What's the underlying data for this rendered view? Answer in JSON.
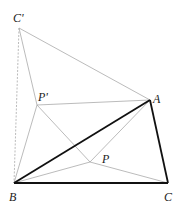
{
  "diagram": {
    "points": {
      "C_prime": {
        "label": "C'",
        "x": 19,
        "y": 28
      },
      "A": {
        "label": "A",
        "x": 150,
        "y": 100
      },
      "P_prime": {
        "label": "P'",
        "x": 37,
        "y": 105
      },
      "P": {
        "label": "P",
        "x": 90,
        "y": 162
      },
      "B": {
        "label": "B",
        "x": 14,
        "y": 183
      },
      "C": {
        "label": "C",
        "x": 168,
        "y": 183
      }
    },
    "colors": {
      "bold": "#111111",
      "thin": "#aaaaaa"
    }
  }
}
